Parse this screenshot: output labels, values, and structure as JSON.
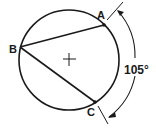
{
  "diagram": {
    "type": "geometry-inscribed-angle",
    "colors": {
      "stroke": "#1a1a1a",
      "background": "#ffffff"
    },
    "points": [
      {
        "label": "A"
      },
      {
        "label": "B"
      },
      {
        "label": "C"
      }
    ],
    "center_marker": "+",
    "arc_measure": "105°",
    "chords": [
      "BA",
      "BC"
    ]
  }
}
